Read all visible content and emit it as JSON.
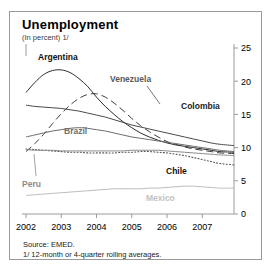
{
  "figure": {
    "title": "Unemployment",
    "subtitle": "(In percent) 1/",
    "source": "Source:  EMED.",
    "footnote": "1/ 12-month or 4-quarter rolling averages."
  },
  "labels": {
    "argentina": "Argentina",
    "venezuela": "Venezuela",
    "colombia": "Colombia",
    "brazil": "Brazil",
    "chile": "Chile",
    "peru": "Peru",
    "mexico": "Mexico"
  },
  "colors": {
    "argentina": "#2b2b2b",
    "venezuela": "#3d3d3d",
    "colombia": "#4a4a4a",
    "brazil": "#6d6d6d",
    "chile": "#555555",
    "peru": "#8c8c8c",
    "mexico": "#bdbdbd",
    "axis": "#9a9a9a",
    "frame": "#9a9a9a",
    "text": "#000000"
  },
  "chart_data": {
    "type": "line",
    "title": "Unemployment",
    "subtitle": "(In percent) 1/",
    "xlabel": "",
    "ylabel": "",
    "ylim": [
      0,
      25
    ],
    "yticks": [
      0,
      5,
      10,
      15,
      20,
      25
    ],
    "ytick_labels": [
      "0",
      "5",
      "10",
      "15",
      "20",
      "25"
    ],
    "xlim": [
      2002.0,
      2007.9
    ],
    "xticks": [
      2002,
      2003,
      2004,
      2005,
      2006,
      2007
    ],
    "xtick_labels": [
      "2002",
      "2003",
      "2004",
      "2005",
      "2006",
      "2007"
    ],
    "grid": false,
    "legend": "inline-annotations",
    "x": [
      2002.0,
      2002.25,
      2002.5,
      2002.75,
      2003.0,
      2003.25,
      2003.5,
      2003.75,
      2004.0,
      2004.25,
      2004.5,
      2004.75,
      2005.0,
      2005.25,
      2005.5,
      2005.75,
      2006.0,
      2006.25,
      2006.5,
      2006.75,
      2007.0,
      2007.25,
      2007.5,
      2007.9
    ],
    "series": [
      {
        "name": "Argentina",
        "style": "solid",
        "color": "#2b2b2b",
        "values": [
          18.3,
          19.8,
          21.0,
          21.6,
          21.7,
          21.3,
          20.4,
          19.2,
          17.6,
          16.2,
          15.0,
          13.9,
          13.0,
          12.2,
          11.6,
          11.1,
          10.7,
          10.4,
          10.2,
          10.0,
          9.8,
          9.6,
          9.4,
          9.3
        ],
        "label_position": "top-left"
      },
      {
        "name": "Venezuela",
        "style": "dashed",
        "color": "#3d3d3d",
        "values": [
          9.4,
          10.6,
          12.0,
          13.6,
          15.1,
          16.4,
          17.4,
          18.0,
          18.1,
          17.6,
          16.7,
          15.6,
          14.4,
          13.3,
          12.4,
          11.6,
          10.9,
          10.5,
          10.1,
          9.8,
          9.6,
          9.4,
          9.2,
          9.1
        ],
        "label_position": "upper-middle"
      },
      {
        "name": "Colombia",
        "style": "solid",
        "color": "#4a4a4a",
        "values": [
          16.4,
          16.2,
          16.1,
          16.0,
          15.9,
          15.7,
          15.5,
          15.2,
          14.9,
          14.6,
          14.2,
          13.8,
          13.4,
          13.1,
          12.8,
          12.5,
          12.2,
          11.9,
          11.6,
          11.3,
          11.0,
          10.7,
          10.5,
          10.3
        ],
        "label_position": "right-upper"
      },
      {
        "name": "Brazil",
        "style": "solid",
        "color": "#6d6d6d",
        "values": [
          11.6,
          11.9,
          12.2,
          12.5,
          12.7,
          12.9,
          13.0,
          12.9,
          12.7,
          12.5,
          12.2,
          11.9,
          11.6,
          11.4,
          11.2,
          11.0,
          10.8,
          10.6,
          10.4,
          10.2,
          10.0,
          9.8,
          9.6,
          9.4
        ],
        "label_position": "middle-left"
      },
      {
        "name": "Chile",
        "style": "dotted",
        "color": "#555555",
        "values": [
          9.8,
          9.7,
          9.6,
          9.5,
          9.4,
          9.3,
          9.3,
          9.2,
          9.2,
          9.2,
          9.2,
          9.3,
          9.3,
          9.4,
          9.4,
          9.3,
          9.2,
          9.0,
          8.8,
          8.5,
          8.2,
          7.9,
          7.6,
          7.4
        ],
        "label_position": "middle-right"
      },
      {
        "name": "Peru",
        "style": "solid",
        "color": "#8c8c8c",
        "values": [
          9.7,
          9.6,
          9.6,
          9.6,
          9.5,
          9.5,
          9.5,
          9.5,
          9.5,
          9.5,
          9.5,
          9.5,
          9.6,
          9.6,
          9.6,
          9.6,
          9.5,
          9.4,
          9.3,
          9.2,
          9.1,
          9.0,
          8.9,
          8.8
        ],
        "label_position": "lower-left"
      },
      {
        "name": "Mexico",
        "style": "solid",
        "color": "#bdbdbd",
        "values": [
          2.8,
          2.9,
          3.0,
          3.1,
          3.2,
          3.3,
          3.4,
          3.5,
          3.6,
          3.7,
          3.8,
          3.8,
          3.8,
          3.8,
          3.9,
          3.9,
          4.0,
          4.1,
          4.2,
          4.2,
          4.1,
          4.0,
          3.9,
          3.9
        ],
        "label_position": "bottom-middle"
      }
    ]
  }
}
